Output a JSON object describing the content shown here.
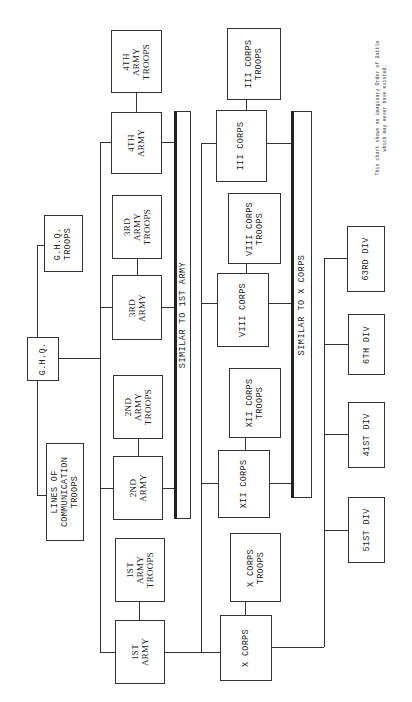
{
  "note": "This chart shows an imaginary Order of Battle\nwhich may never have existed.",
  "ghq": {
    "hq": "G.H.Q.",
    "troops": "G.H.Q.\nTROOPS",
    "loc_troops": "LINES OF\nCOMMUNICATION\nTROOPS"
  },
  "armies": [
    {
      "name": "1ST\nARMY",
      "troops": "1ST\nARMY\nTROOPS"
    },
    {
      "name": "2ND\nARMY",
      "troops": "2ND\nARMY\nTROOPS"
    },
    {
      "name": "3RD\nARMY",
      "troops": "3RD\nARMY\nTROOPS"
    },
    {
      "name": "4TH\nARMY",
      "troops": "4TH\nARMY\nTROOPS"
    }
  ],
  "armies_bar": "SIMILAR TO 1ST ARMY",
  "corps": [
    {
      "name": "X CORPS",
      "troops": "X CORPS\nTROOPS"
    },
    {
      "name": "XII CORPS",
      "troops": "XII CORPS\nTROOPS"
    },
    {
      "name": "VIII CORPS",
      "troops": "VIII CORPS\nTROOPS"
    },
    {
      "name": "III CORPS",
      "troops": "III CORPS\nTROOPS"
    }
  ],
  "corps_bar": "SIMILAR TO X CORPS",
  "divisions": [
    "51ST DIV",
    "41ST DIV",
    "6TH DIV",
    "63RD DIV"
  ]
}
